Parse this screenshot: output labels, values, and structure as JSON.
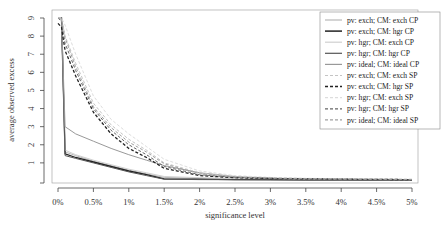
{
  "chart_data": {
    "type": "line",
    "title": "",
    "xlabel": "significance level",
    "ylabel": "average observed excess",
    "xlim": [
      0,
      5
    ],
    "ylim": [
      0,
      9
    ],
    "x_tick_labels": [
      "0%",
      "0.5%",
      "1%",
      "1.5%",
      "2%",
      "2.5%",
      "3%",
      "3.5%",
      "4%",
      "4.5%",
      "5%"
    ],
    "y_tick_labels": [
      "1",
      "2",
      "3",
      "4",
      "5",
      "6",
      "7",
      "8",
      "9"
    ],
    "grid": false,
    "legend_position": "upper right",
    "x": [
      0.05,
      0.1,
      0.25,
      0.5,
      0.75,
      1.0,
      1.25,
      1.5,
      2.0,
      2.5,
      3.0,
      3.5,
      4.0,
      4.5,
      5.0
    ],
    "series": [
      {
        "name": "pv: exch;  CM: exch CP",
        "color": "#b8b8b8",
        "dash": "",
        "width": 1,
        "values": [
          9.0,
          1.6,
          1.4,
          1.1,
          0.85,
          0.6,
          0.4,
          0.2,
          0.15,
          0.12,
          0.1,
          0.09,
          0.08,
          0.07,
          0.06
        ]
      },
      {
        "name": "pv: exch;  CM: hgr CP",
        "color": "#222222",
        "dash": "",
        "width": 1.3,
        "values": [
          9.0,
          1.5,
          1.3,
          1.05,
          0.8,
          0.55,
          0.35,
          0.12,
          0.1,
          0.08,
          0.07,
          0.06,
          0.06,
          0.05,
          0.05
        ]
      },
      {
        "name": "pv: hgr;  CM: exch CP",
        "color": "#d0d0d0",
        "dash": "",
        "width": 1,
        "values": [
          9.0,
          1.7,
          1.45,
          1.15,
          0.9,
          0.65,
          0.45,
          0.25,
          0.18,
          0.14,
          0.12,
          0.1,
          0.09,
          0.08,
          0.07
        ]
      },
      {
        "name": "pv: hgr;  CM: hgr CP",
        "color": "#555555",
        "dash": "",
        "width": 1,
        "values": [
          9.0,
          1.4,
          1.25,
          1.0,
          0.75,
          0.5,
          0.3,
          0.1,
          0.08,
          0.07,
          0.06,
          0.05,
          0.05,
          0.05,
          0.04
        ]
      },
      {
        "name": "pv: ideal; CM: ideal CP",
        "color": "#999999",
        "dash": "",
        "width": 1,
        "values": [
          9.0,
          3.0,
          2.6,
          2.2,
          1.8,
          1.45,
          1.15,
          0.85,
          0.45,
          0.25,
          0.15,
          0.1,
          0.08,
          0.07,
          0.06
        ]
      },
      {
        "name": "pv: exch;  CM: exch SP",
        "color": "#c4c4c4",
        "dash": "3,2",
        "width": 1,
        "values": [
          9.0,
          8.0,
          6.5,
          4.3,
          3.1,
          2.3,
          1.7,
          1.0,
          0.45,
          0.25,
          0.18,
          0.14,
          0.12,
          0.1,
          0.09
        ]
      },
      {
        "name": "pv: exch;  CM: hgr SP",
        "color": "#222222",
        "dash": "3,2",
        "width": 1.3,
        "values": [
          8.5,
          7.2,
          5.8,
          3.8,
          2.6,
          1.8,
          1.3,
          0.7,
          0.3,
          0.18,
          0.14,
          0.12,
          0.1,
          0.09,
          0.08
        ]
      },
      {
        "name": "pv: hgr;  CM: exch SP",
        "color": "#dddddd",
        "dash": "3,2",
        "width": 1,
        "values": [
          9.0,
          8.6,
          7.0,
          4.7,
          3.4,
          2.6,
          1.9,
          1.2,
          0.55,
          0.3,
          0.2,
          0.15,
          0.12,
          0.1,
          0.09
        ]
      },
      {
        "name": "pv: hgr;  CM: hgr SP",
        "color": "#666666",
        "dash": "3,2",
        "width": 1,
        "values": [
          8.8,
          7.6,
          6.1,
          4.0,
          2.8,
          2.0,
          1.45,
          0.8,
          0.35,
          0.2,
          0.15,
          0.12,
          0.1,
          0.09,
          0.08
        ]
      },
      {
        "name": "pv: ideal; CM: ideal SP",
        "color": "#a0a0a0",
        "dash": "3,2",
        "width": 1,
        "values": [
          8.9,
          7.9,
          6.3,
          4.1,
          2.95,
          2.15,
          1.6,
          0.95,
          0.4,
          0.22,
          0.16,
          0.13,
          0.11,
          0.1,
          0.09
        ]
      }
    ]
  }
}
